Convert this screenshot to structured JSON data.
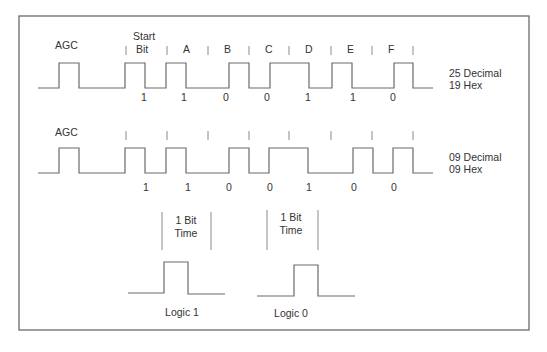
{
  "diagram": {
    "waveform1": {
      "agc_label": "AGC",
      "start_label_line1": "Start",
      "start_label_line2": "Bit",
      "bit_letters": [
        "A",
        "B",
        "C",
        "D",
        "E",
        "F"
      ],
      "bit_values": [
        "1",
        "1",
        "0",
        "0",
        "1",
        "1",
        "0"
      ],
      "decimal_label": "25 Decimal",
      "hex_label": "19 Hex"
    },
    "waveform2": {
      "agc_label": "AGC",
      "bit_values": [
        "1",
        "1",
        "0",
        "0",
        "1",
        "0",
        "0"
      ],
      "decimal_label": "09 Decimal",
      "hex_label": "09 Hex"
    },
    "legend": {
      "logic1": {
        "bit_time_line1": "1 Bit",
        "bit_time_line2": "Time",
        "label": "Logic 1"
      },
      "logic0": {
        "bit_time_line1": "1 Bit",
        "bit_time_line2": "Time",
        "label": "Logic 0"
      }
    },
    "colors": {
      "line": "#6a6a6a",
      "text": "#333333",
      "background": "#ffffff"
    }
  }
}
